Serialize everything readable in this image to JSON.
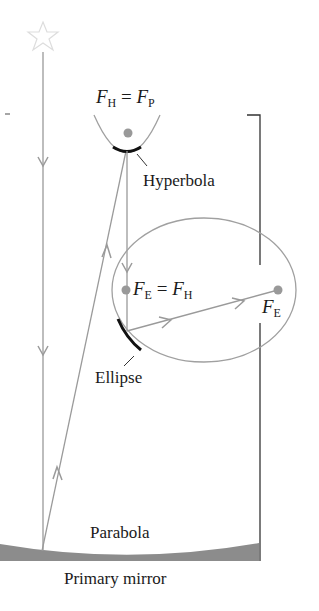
{
  "labels": {
    "hyperbola_focus": {
      "left_var": "F",
      "left_sub": "H",
      "eq": "=",
      "right_var": "F",
      "right_sub": "P"
    },
    "ellipse_focus": {
      "left_var": "F",
      "left_sub": "E",
      "eq": "=",
      "right_var": "F",
      "right_sub": "H"
    },
    "image_focus": {
      "var": "F",
      "sub": "E"
    },
    "hyperbola": "Hyperbola",
    "ellipse": "Ellipse",
    "parabola": "Parabola",
    "primary_mirror": "Primary mirror"
  },
  "colors": {
    "ray": "#9a9a9a",
    "mirror_fill": "#8c8c8c",
    "curve": "#a0a0a0",
    "mirror_segment": "#111111",
    "frame": "#333333",
    "focus_dot": "#999999",
    "star": "#dddddd"
  }
}
